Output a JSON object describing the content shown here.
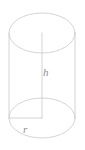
{
  "figure": {
    "name": "cylinder-diagram",
    "background_color": "#ffffff",
    "stroke_color": "#c9c9cd",
    "label_color": "#8f8f93",
    "stroke_width": 0.8,
    "labels": {
      "height": "h",
      "radius": "r"
    },
    "geometry": {
      "center_x": 42,
      "radius_x": 33,
      "radius_y": 20,
      "top_center_y": 33,
      "bottom_center_y": 118,
      "left_wall_x": 9,
      "right_wall_x": 75
    }
  },
  "chart_data": {
    "type": "diagram",
    "shape": "right circular cylinder",
    "annotations": [
      {
        "symbol": "h",
        "meaning": "height",
        "line": "vertical axis from top face center to bottom face center"
      },
      {
        "symbol": "r",
        "meaning": "radius",
        "line": "horizontal segment from bottom face center to bottom face left edge"
      }
    ]
  }
}
